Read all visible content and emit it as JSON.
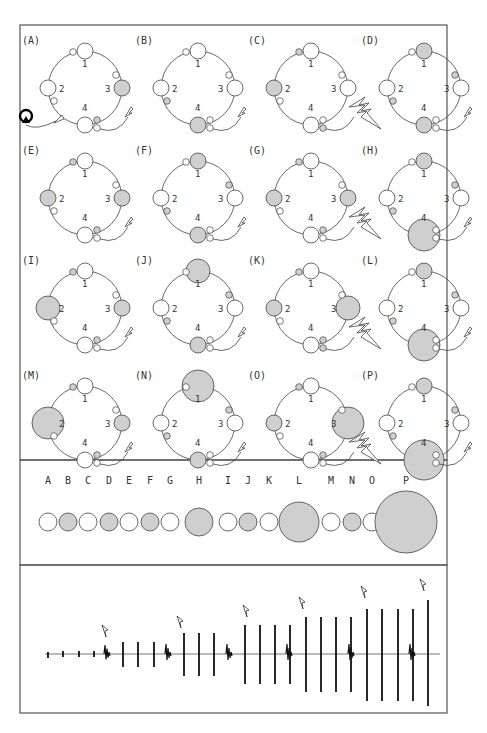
{
  "figure": {
    "colors": {
      "filled": "#cfcfcf",
      "empty": "#ffffff",
      "stroke": "#444444",
      "frame": "#555555"
    },
    "ring_numbers": [
      "1",
      "2",
      "3",
      "4"
    ],
    "panels": [
      {
        "label": "(A)",
        "big": {
          "1": "empty",
          "2": "empty",
          "3": "filled",
          "4": "empty"
        },
        "sizes": {
          "1": 1,
          "2": 1,
          "3": 1,
          "4": 1
        },
        "small": {
          "a": "empty",
          "b": "empty",
          "c": "empty",
          "d": "filled",
          "e": "empty"
        },
        "stim": "small",
        "recorder": true
      },
      {
        "label": "(B)",
        "big": {
          "1": "empty",
          "2": "empty",
          "3": "empty",
          "4": "filled"
        },
        "sizes": {
          "1": 1,
          "2": 1,
          "3": 1,
          "4": 1
        },
        "small": {
          "a": "empty",
          "b": "filled",
          "c": "empty",
          "d": "empty",
          "e": "empty"
        },
        "stim": "small"
      },
      {
        "label": "(C)",
        "big": {
          "1": "empty",
          "2": "filled",
          "3": "empty",
          "4": "empty"
        },
        "sizes": {
          "1": 1,
          "2": 1,
          "3": 1,
          "4": 1
        },
        "small": {
          "a": "filled",
          "b": "empty",
          "c": "empty",
          "d": "empty",
          "e": "filled"
        },
        "stim": "large"
      },
      {
        "label": "(D)",
        "big": {
          "1": "filled",
          "2": "empty",
          "3": "empty",
          "4": "filled"
        },
        "sizes": {
          "1": 1,
          "2": 1,
          "3": 1,
          "4": 1
        },
        "small": {
          "a": "empty",
          "b": "filled",
          "c": "filled",
          "d": "empty",
          "e": "empty"
        },
        "stim": "small"
      },
      {
        "label": "(E)",
        "big": {
          "1": "empty",
          "2": "filled",
          "3": "filled",
          "4": "empty"
        },
        "sizes": {
          "1": 1,
          "2": 1,
          "3": 1,
          "4": 1
        },
        "small": {
          "a": "filled",
          "b": "empty",
          "c": "empty",
          "d": "filled",
          "e": "empty"
        },
        "stim": "small"
      },
      {
        "label": "(F)",
        "big": {
          "1": "filled",
          "2": "empty",
          "3": "empty",
          "4": "filled"
        },
        "sizes": {
          "1": 1,
          "2": 1,
          "3": 1,
          "4": 1
        },
        "small": {
          "a": "empty",
          "b": "filled",
          "c": "filled",
          "d": "empty",
          "e": "empty"
        },
        "stim": "small"
      },
      {
        "label": "(G)",
        "big": {
          "1": "empty",
          "2": "filled",
          "3": "filled",
          "4": "empty"
        },
        "sizes": {
          "1": 1,
          "2": 1,
          "3": 1,
          "4": 1
        },
        "small": {
          "a": "filled",
          "b": "empty",
          "c": "empty",
          "d": "filled",
          "e": "empty"
        },
        "stim": "large"
      },
      {
        "label": "(H)",
        "big": {
          "1": "filled",
          "2": "empty",
          "3": "empty",
          "4": "filled"
        },
        "sizes": {
          "1": 1,
          "2": 1,
          "3": 1,
          "4": 2
        },
        "small": {
          "a": "empty",
          "b": "filled",
          "c": "filled",
          "d": "empty",
          "e": "empty"
        },
        "stim": "small"
      },
      {
        "label": "(I)",
        "big": {
          "1": "empty",
          "2": "filled",
          "3": "filled",
          "4": "empty"
        },
        "sizes": {
          "1": 1,
          "2": 1.5,
          "3": 1,
          "4": 1
        },
        "small": {
          "a": "filled",
          "b": "empty",
          "c": "empty",
          "d": "filled",
          "e": "empty"
        },
        "stim": "small"
      },
      {
        "label": "(J)",
        "big": {
          "1": "filled",
          "2": "empty",
          "3": "empty",
          "4": "filled"
        },
        "sizes": {
          "1": 1.5,
          "2": 1,
          "3": 1,
          "4": 1
        },
        "small": {
          "a": "empty",
          "b": "filled",
          "c": "filled",
          "d": "empty",
          "e": "empty"
        },
        "stim": "small"
      },
      {
        "label": "(K)",
        "big": {
          "1": "empty",
          "2": "filled",
          "3": "filled",
          "4": "empty"
        },
        "sizes": {
          "1": 1,
          "2": 1,
          "3": 1.5,
          "4": 1
        },
        "small": {
          "a": "filled",
          "b": "empty",
          "c": "empty",
          "d": "filled",
          "e": "filled"
        },
        "stim": "large"
      },
      {
        "label": "(L)",
        "big": {
          "1": "filled",
          "2": "empty",
          "3": "empty",
          "4": "filled"
        },
        "sizes": {
          "1": 1,
          "2": 1,
          "3": 1,
          "4": 2
        },
        "small": {
          "a": "empty",
          "b": "filled",
          "c": "filled",
          "d": "empty",
          "e": "empty"
        },
        "stim": "small"
      },
      {
        "label": "(M)",
        "big": {
          "1": "empty",
          "2": "filled",
          "3": "filled",
          "4": "empty"
        },
        "sizes": {
          "1": 1,
          "2": 2,
          "3": 1,
          "4": 1
        },
        "small": {
          "a": "filled",
          "b": "empty",
          "c": "empty",
          "d": "filled",
          "e": "empty"
        },
        "stim": "small"
      },
      {
        "label": "(N)",
        "big": {
          "1": "filled",
          "2": "empty",
          "3": "empty",
          "4": "filled"
        },
        "sizes": {
          "1": 2,
          "2": 1,
          "3": 1,
          "4": 1
        },
        "small": {
          "a": "empty",
          "b": "filled",
          "c": "filled",
          "d": "empty",
          "e": "empty"
        },
        "stim": "small"
      },
      {
        "label": "(O)",
        "big": {
          "1": "empty",
          "2": "filled",
          "3": "filled",
          "4": "empty"
        },
        "sizes": {
          "1": 1,
          "2": 1,
          "3": 2,
          "4": 1
        },
        "small": {
          "a": "filled",
          "b": "empty",
          "c": "empty",
          "d": "filled",
          "e": "empty"
        },
        "stim": "large"
      },
      {
        "label": "(P)",
        "big": {
          "1": "filled",
          "2": "empty",
          "3": "empty",
          "4": "filled"
        },
        "sizes": {
          "1": 1,
          "2": 1,
          "3": 1,
          "4": 2.5
        },
        "small": {
          "a": "empty",
          "b": "filled",
          "c": "filled",
          "d": "empty",
          "e": "empty"
        },
        "stim": "small"
      }
    ],
    "sequence": {
      "labels": [
        "A",
        "B",
        "C",
        "D",
        "E",
        "F",
        "G",
        "H",
        "I",
        "J",
        "K",
        "L",
        "M",
        "N",
        "O",
        "P"
      ],
      "fills": [
        "empty",
        "filled",
        "empty",
        "filled",
        "empty",
        "filled",
        "empty",
        "filled",
        "empty",
        "filled",
        "empty",
        "filled",
        "empty",
        "filled",
        "empty",
        "filled"
      ],
      "radii": [
        9,
        9,
        9,
        9,
        9,
        9,
        9,
        14,
        9,
        9,
        9,
        20,
        9,
        9,
        9,
        31
      ]
    },
    "trace": {
      "spikes": [
        {
          "x": 48,
          "up": 2,
          "down": 4
        },
        {
          "x": 63,
          "up": 3,
          "down": 3
        },
        {
          "x": 79,
          "up": 3,
          "down": 3
        },
        {
          "x": 94,
          "up": 3,
          "down": 3
        },
        {
          "x": 123,
          "up": 12,
          "down": 13
        },
        {
          "x": 138,
          "up": 12,
          "down": 13
        },
        {
          "x": 154,
          "up": 12,
          "down": 13
        },
        {
          "x": 184,
          "up": 21,
          "down": 22
        },
        {
          "x": 199,
          "up": 21,
          "down": 22
        },
        {
          "x": 214,
          "up": 21,
          "down": 22
        },
        {
          "x": 245,
          "up": 29,
          "down": 30
        },
        {
          "x": 260,
          "up": 29,
          "down": 30
        },
        {
          "x": 275,
          "up": 29,
          "down": 30
        },
        {
          "x": 290,
          "up": 29,
          "down": 30
        },
        {
          "x": 306,
          "up": 37,
          "down": 38
        },
        {
          "x": 321,
          "up": 37,
          "down": 38
        },
        {
          "x": 336,
          "up": 37,
          "down": 38
        },
        {
          "x": 351,
          "up": 37,
          "down": 38
        },
        {
          "x": 367,
          "up": 45,
          "down": 47
        },
        {
          "x": 382,
          "up": 45,
          "down": 47
        },
        {
          "x": 398,
          "up": 45,
          "down": 47
        },
        {
          "x": 413,
          "up": 45,
          "down": 47
        },
        {
          "x": 428,
          "up": 54,
          "down": 52
        }
      ],
      "bursts": [
        {
          "x": 107,
          "amp": 9
        },
        {
          "x": 168,
          "amp": 10
        },
        {
          "x": 229,
          "amp": 10
        },
        {
          "x": 289,
          "amp": 10
        },
        {
          "x": 351,
          "amp": 10
        },
        {
          "x": 412,
          "amp": 10
        }
      ],
      "stim_markers_x": [
        102,
        177,
        243,
        299,
        361,
        420
      ],
      "stim_markers_y": [
        625,
        616,
        605,
        597,
        586,
        579
      ]
    }
  }
}
